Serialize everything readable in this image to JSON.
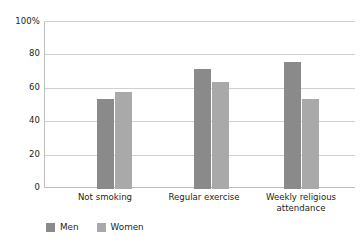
{
  "chart_data": {
    "type": "bar",
    "title": "",
    "subtitle": "",
    "xlabel": "",
    "ylabel": "",
    "ylim": [
      0,
      100
    ],
    "yticks": [
      "0",
      "20",
      "40",
      "60",
      "80",
      "100%"
    ],
    "ytick_values": [
      0,
      20,
      40,
      60,
      80,
      100
    ],
    "grid": "horizontal",
    "legend_position": "bottom-left",
    "categories": [
      "Not smoking",
      "Regular exercise",
      "Weekly religious attendance"
    ],
    "series": [
      {
        "name": "Men",
        "color": "#8a8a8a",
        "values": [
          54,
          72,
          76
        ]
      },
      {
        "name": "Women",
        "color": "#a9a9a9",
        "values": [
          58,
          64,
          54
        ]
      }
    ]
  },
  "axis": {
    "ticks": [
      {
        "label": "100%",
        "value": 100
      },
      {
        "label": "80",
        "value": 80
      },
      {
        "label": "60",
        "value": 60
      },
      {
        "label": "40",
        "value": 40
      },
      {
        "label": "20",
        "value": 20
      },
      {
        "label": "0",
        "value": 0
      }
    ]
  },
  "categories": [
    {
      "line1": "Not smoking",
      "line2": ""
    },
    {
      "line1": "Regular exercise",
      "line2": ""
    },
    {
      "line1": "Weekly religious",
      "line2": "attendance"
    }
  ],
  "legend": [
    {
      "label": "Men",
      "color": "#8a8a8a"
    },
    {
      "label": "Women",
      "color": "#a9a9a9"
    }
  ]
}
